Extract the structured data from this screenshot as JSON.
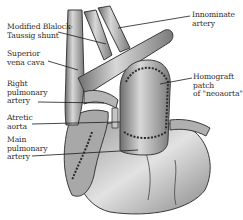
{
  "figure": {
    "labels": [
      {
        "id": "modified-blalock-taussig-shunt",
        "text": "Modified Blalock-\nTaussig shunt"
      },
      {
        "id": "superior-vena-cava",
        "text": "Superior\nvena cava"
      },
      {
        "id": "right-pulmonary-artery",
        "text": "Right\npulmonary\nartery"
      },
      {
        "id": "atretic-aorta",
        "text": "Atretic\naorta"
      },
      {
        "id": "main-pulmonary-artery",
        "text": "Main\npulmonary\nartery"
      },
      {
        "id": "innominate-artery",
        "text": "Innominate\nartery"
      },
      {
        "id": "homograft-patch",
        "text": "Homograft\npatch\nof \"neoaorta\""
      }
    ]
  }
}
